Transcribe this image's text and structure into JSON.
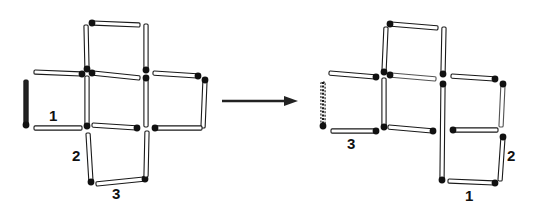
{
  "colors": {
    "stick_fill": "#ffffff",
    "stick_outline": "#1a1a1a",
    "head": "#111111",
    "dark_stick": "#222222",
    "arrow": "#222222"
  },
  "figures": [
    {
      "name": "before",
      "sticks": [
        {
          "id": "L-top-top",
          "x1": 92,
          "y1": 23,
          "x2": 140,
          "y2": 25,
          "head": "start"
        },
        {
          "id": "L-top-left",
          "x1": 86,
          "y1": 25,
          "x2": 87,
          "y2": 69,
          "head": "end"
        },
        {
          "id": "L-top-right",
          "x1": 146,
          "y1": 24,
          "x2": 146,
          "y2": 70,
          "head": "end"
        },
        {
          "id": "L-left-top",
          "x1": 34,
          "y1": 72,
          "x2": 82,
          "y2": 74,
          "head": "end"
        },
        {
          "id": "L-left-side",
          "x1": 26,
          "y1": 80,
          "x2": 26,
          "y2": 125,
          "head": "end",
          "style": "dark"
        },
        {
          "id": "L-left-bottom",
          "x1": 34,
          "y1": 128,
          "x2": 82,
          "y2": 128,
          "head": "none",
          "label": "1"
        },
        {
          "id": "L-mid-top",
          "x1": 92,
          "y1": 73,
          "x2": 140,
          "y2": 78,
          "head": "start"
        },
        {
          "id": "L-mid-left",
          "x1": 87,
          "y1": 76,
          "x2": 87,
          "y2": 126,
          "head": "end"
        },
        {
          "id": "L-mid-bottom",
          "x1": 92,
          "y1": 125,
          "x2": 137,
          "y2": 128,
          "head": "end"
        },
        {
          "id": "L-mid-right",
          "x1": 146,
          "y1": 78,
          "x2": 146,
          "y2": 127,
          "head": "start"
        },
        {
          "id": "L-right-top",
          "x1": 153,
          "y1": 73,
          "x2": 198,
          "y2": 76,
          "head": "end"
        },
        {
          "id": "L-right-side",
          "x1": 205,
          "y1": 80,
          "x2": 203,
          "y2": 128,
          "head": "start"
        },
        {
          "id": "L-right-bottom",
          "x1": 155,
          "y1": 128,
          "x2": 202,
          "y2": 128,
          "head": "start"
        },
        {
          "id": "L-bottom-left",
          "x1": 88,
          "y1": 133,
          "x2": 91,
          "y2": 182,
          "head": "end",
          "label": "2"
        },
        {
          "id": "L-bottom-bottom",
          "x1": 96,
          "y1": 184,
          "x2": 145,
          "y2": 179,
          "head": "end",
          "label": "3"
        },
        {
          "id": "L-bottom-right",
          "x1": 147,
          "y1": 131,
          "x2": 146,
          "y2": 177,
          "head": "none"
        }
      ],
      "labels": [
        {
          "text": "1",
          "x": 49,
          "y": 108
        },
        {
          "text": "2",
          "x": 72,
          "y": 148
        },
        {
          "text": "3",
          "x": 112,
          "y": 186
        }
      ]
    },
    {
      "name": "after",
      "sticks": [
        {
          "id": "R-top-top",
          "x1": 390,
          "y1": 24,
          "x2": 438,
          "y2": 28,
          "head": "start"
        },
        {
          "id": "R-top-left",
          "x1": 386,
          "y1": 27,
          "x2": 384,
          "y2": 72,
          "head": "end"
        },
        {
          "id": "R-top-right",
          "x1": 444,
          "y1": 27,
          "x2": 443,
          "y2": 74,
          "head": "end"
        },
        {
          "id": "R-left-top",
          "x1": 329,
          "y1": 73,
          "x2": 376,
          "y2": 77,
          "head": "end"
        },
        {
          "id": "R-left-side",
          "x1": 323,
          "y1": 82,
          "x2": 323,
          "y2": 126,
          "head": "end",
          "style": "dotted"
        },
        {
          "id": "R-left-bottom",
          "x1": 331,
          "y1": 131,
          "x2": 376,
          "y2": 131,
          "head": "end",
          "label": "3"
        },
        {
          "id": "R-mid-top",
          "x1": 390,
          "y1": 75,
          "x2": 436,
          "y2": 79,
          "head": "start",
          "style": "faint"
        },
        {
          "id": "R-mid-left",
          "x1": 384,
          "y1": 78,
          "x2": 384,
          "y2": 127,
          "head": "end"
        },
        {
          "id": "R-mid-bottom",
          "x1": 388,
          "y1": 127,
          "x2": 433,
          "y2": 131,
          "head": "end"
        },
        {
          "id": "R-center-long",
          "x1": 443,
          "y1": 84,
          "x2": 442,
          "y2": 180,
          "head": "both"
        },
        {
          "id": "R-right-top",
          "x1": 451,
          "y1": 76,
          "x2": 495,
          "y2": 79,
          "head": "end"
        },
        {
          "id": "R-right-side",
          "x1": 503,
          "y1": 84,
          "x2": 501,
          "y2": 127,
          "head": "start",
          "style": "faint"
        },
        {
          "id": "R-right-mid",
          "x1": 453,
          "y1": 130,
          "x2": 498,
          "y2": 130,
          "head": "start"
        },
        {
          "id": "R-lower-right",
          "x1": 503,
          "y1": 137,
          "x2": 500,
          "y2": 181,
          "head": "start",
          "label": "2"
        },
        {
          "id": "R-lower-bottom",
          "x1": 448,
          "y1": 181,
          "x2": 495,
          "y2": 183,
          "head": "end",
          "label": "1"
        }
      ],
      "labels": [
        {
          "text": "3",
          "x": 347,
          "y": 136
        },
        {
          "text": "2",
          "x": 507,
          "y": 148
        },
        {
          "text": "1",
          "x": 465,
          "y": 188
        }
      ]
    }
  ],
  "arrow": {
    "x1": 222,
    "y1": 101,
    "x2": 298,
    "y2": 101,
    "direction": "right"
  }
}
